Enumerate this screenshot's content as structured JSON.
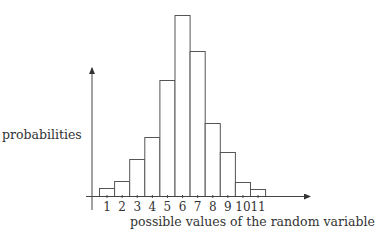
{
  "chart_data": {
    "type": "bar",
    "title": "",
    "xlabel": "possible values of the random variable",
    "ylabel": "probabilities",
    "categories": [
      "1",
      "2",
      "3",
      "4",
      "5",
      "6",
      "7",
      "8",
      "9",
      "10",
      "11"
    ],
    "values": [
      8,
      15,
      37,
      59,
      116,
      181,
      145,
      73,
      44,
      14,
      7
    ],
    "value_units": "relative bar height (px), no y tick labels shown",
    "grid": false,
    "legend": null,
    "axis_arrows": true,
    "colors": {
      "bar_fill": "#ffffff",
      "bar_stroke": "#555555",
      "axis": "#444444"
    }
  }
}
